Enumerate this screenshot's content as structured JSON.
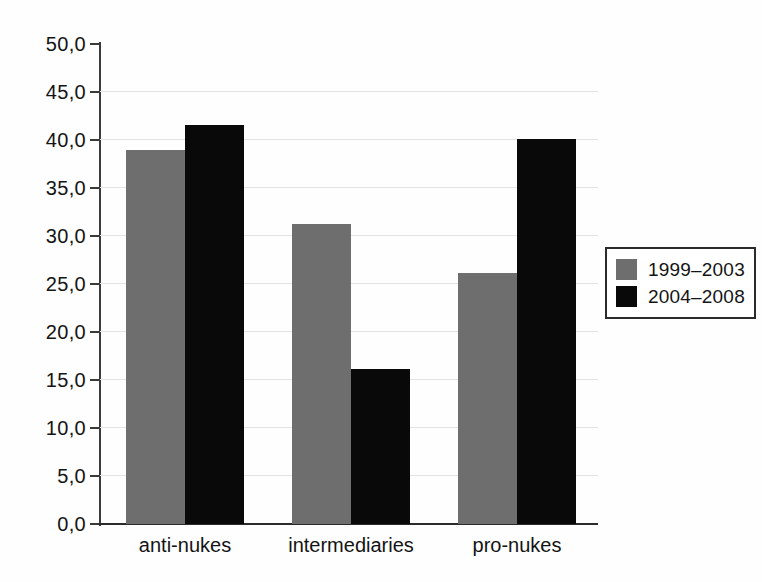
{
  "chart_data": {
    "type": "bar",
    "title": "",
    "xlabel": "",
    "ylabel": "",
    "categories": [
      "anti-nukes",
      "intermediaries",
      "pro-nukes"
    ],
    "series": [
      {
        "name": "1999–2003",
        "color": "#6e6e6e",
        "values": [
          39.0,
          31.2,
          26.1
        ]
      },
      {
        "name": "2004–2008",
        "color": "#090909",
        "values": [
          41.6,
          16.1,
          40.1
        ]
      }
    ],
    "ylim": [
      0,
      50
    ],
    "ytick_values": [
      0,
      5,
      10,
      15,
      20,
      25,
      30,
      35,
      40,
      45,
      50
    ],
    "ytick_labels": [
      "0,0",
      "5,0",
      "10,0",
      "15,0",
      "20,0",
      "25,0",
      "30,0",
      "35,0",
      "40,0",
      "45,0",
      "50,0"
    ],
    "grid": true,
    "grid_axis": "y",
    "legend_position": "right",
    "decimal_separator": ","
  },
  "legend": {
    "entries": [
      {
        "label": "1999–2003"
      },
      {
        "label": "2004–2008"
      }
    ]
  }
}
